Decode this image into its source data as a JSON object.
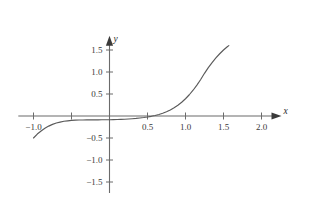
{
  "chart_data": {
    "type": "line",
    "title": "",
    "subtitle": "",
    "xlabel": "x",
    "ylabel": "y",
    "xlim": [
      -1.2,
      2.25
    ],
    "ylim": [
      -1.75,
      1.8
    ],
    "grid": false,
    "legend": null,
    "legend_position": "none",
    "axis_style": "arrows-through-origin",
    "x_ticks": [
      {
        "value": -1.0,
        "label": "−1.0"
      },
      {
        "value": -0.5,
        "label": ""
      },
      {
        "value": 0.5,
        "label": "0.5"
      },
      {
        "value": 1.0,
        "label": "1.0"
      },
      {
        "value": 1.5,
        "label": "1.5"
      },
      {
        "value": 2.0,
        "label": "2.0"
      }
    ],
    "y_ticks": [
      {
        "value": 1.5,
        "label": "1.5"
      },
      {
        "value": 1.0,
        "label": "1.0"
      },
      {
        "value": 0.5,
        "label": "0.5"
      },
      {
        "value": -0.5,
        "label": "−0.5"
      },
      {
        "value": -1.0,
        "label": "−1.0"
      },
      {
        "value": -1.5,
        "label": "−1.5"
      }
    ],
    "series": [
      {
        "name": "curve",
        "color": "#5a5a5a",
        "x": [
          -1.0,
          -0.95,
          -0.9,
          -0.85,
          -0.8,
          -0.75,
          -0.7,
          -0.65,
          -0.6,
          -0.55,
          -0.5,
          -0.45,
          -0.4,
          -0.35,
          -0.3,
          -0.25,
          -0.2,
          -0.15,
          -0.1,
          -0.05,
          0.0,
          0.05,
          0.1,
          0.15,
          0.2,
          0.25,
          0.3,
          0.35,
          0.4,
          0.45,
          0.5,
          0.55,
          0.6,
          0.65,
          0.7,
          0.75,
          0.8,
          0.85,
          0.9,
          0.95,
          1.0,
          1.05,
          1.1,
          1.15,
          1.2,
          1.25,
          1.3,
          1.35,
          1.4,
          1.45,
          1.5,
          1.55,
          1.57
        ],
        "y": [
          -0.5,
          -0.41,
          -0.34,
          -0.28,
          -0.23,
          -0.19,
          -0.16,
          -0.14,
          -0.12,
          -0.11,
          -0.1,
          -0.095,
          -0.092,
          -0.09,
          -0.089,
          -0.088,
          -0.088,
          -0.087,
          -0.086,
          -0.085,
          -0.084,
          -0.082,
          -0.08,
          -0.077,
          -0.073,
          -0.068,
          -0.062,
          -0.055,
          -0.046,
          -0.035,
          -0.022,
          -0.007,
          0.012,
          0.035,
          0.063,
          0.097,
          0.138,
          0.187,
          0.245,
          0.313,
          0.392,
          0.483,
          0.586,
          0.702,
          0.83,
          0.97,
          1.1,
          1.215,
          1.32,
          1.415,
          1.5,
          1.575,
          1.6
        ]
      }
    ],
    "annotations": []
  },
  "axes": {
    "x_axis_label": "x",
    "y_axis_label": "y"
  }
}
